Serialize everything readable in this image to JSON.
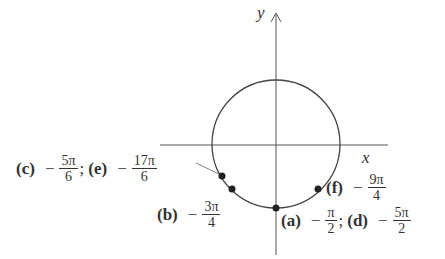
{
  "diagram": {
    "type": "unit-circle",
    "axes": {
      "x_label": "x",
      "y_label": "y"
    },
    "circle": {
      "cx": 276,
      "cy": 144,
      "r": 64
    },
    "points": [
      {
        "id": "ce",
        "x": 222,
        "y": 176
      },
      {
        "id": "b",
        "x": 232,
        "y": 189
      },
      {
        "id": "a",
        "x": 276,
        "y": 208
      },
      {
        "id": "f",
        "x": 318,
        "y": 189
      }
    ]
  },
  "labels": {
    "c": {
      "tag": "(c)",
      "sign": "−",
      "num": "5π",
      "den": "6"
    },
    "sep1": ";",
    "e": {
      "tag": "(e)",
      "sign": "−",
      "num": "17π",
      "den": "6"
    },
    "b": {
      "tag": "(b)",
      "sign": "−",
      "num": "3π",
      "den": "4"
    },
    "a": {
      "tag": "(a)",
      "sign": "−",
      "num": "π",
      "den": "2"
    },
    "sep2": ";",
    "d": {
      "tag": "(d)",
      "sign": "−",
      "num": "5π",
      "den": "2"
    },
    "f": {
      "tag": "(f)",
      "sign": "−",
      "num": "9π",
      "den": "4"
    }
  }
}
